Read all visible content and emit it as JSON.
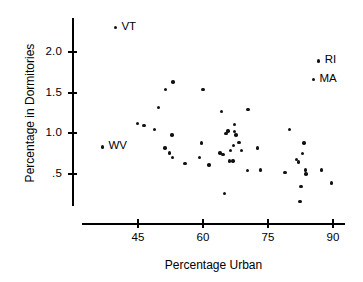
{
  "chart_data": {
    "type": "scatter",
    "title": "",
    "xlabel": "Percentage Urban",
    "ylabel": "Percentage in Dormitories",
    "xlim": [
      36,
      92
    ],
    "ylim": [
      0.1,
      2.45
    ],
    "xticks": [
      45,
      60,
      75,
      90
    ],
    "xtick_labels": [
      "45",
      "60",
      "75",
      "90"
    ],
    "yticks": [
      2.0,
      1.5,
      1.0,
      0.5
    ],
    "ytick_labels": [
      "2.0",
      "1.5",
      "1.0",
      ".5"
    ],
    "grid": false,
    "legend": "none",
    "marker": "dot",
    "marker_color": "#111111",
    "points": [
      {
        "x": 39.8,
        "y": 2.3,
        "label": "VT"
      },
      {
        "x": 36.8,
        "y": 0.83,
        "label": "WV"
      },
      {
        "x": 86.7,
        "y": 1.89,
        "label": "RI"
      },
      {
        "x": 85.5,
        "y": 1.66,
        "label": "MA"
      },
      {
        "x": 44.9,
        "y": 1.12,
        "label": ""
      },
      {
        "x": 46.4,
        "y": 1.1,
        "label": ""
      },
      {
        "x": 48.8,
        "y": 1.05,
        "label": ""
      },
      {
        "x": 49.7,
        "y": 1.32,
        "label": ""
      },
      {
        "x": 51.4,
        "y": 1.54,
        "label": ""
      },
      {
        "x": 53.1,
        "y": 1.63,
        "label": ""
      },
      {
        "x": 52.8,
        "y": 0.98,
        "label": ""
      },
      {
        "x": 51.2,
        "y": 0.82,
        "label": ""
      },
      {
        "x": 52.3,
        "y": 0.76,
        "label": ""
      },
      {
        "x": 53.0,
        "y": 0.7,
        "label": ""
      },
      {
        "x": 55.8,
        "y": 0.63,
        "label": ""
      },
      {
        "x": 59.2,
        "y": 0.7,
        "label": ""
      },
      {
        "x": 59.6,
        "y": 0.88,
        "label": ""
      },
      {
        "x": 60.0,
        "y": 1.54,
        "label": ""
      },
      {
        "x": 61.4,
        "y": 0.61,
        "label": ""
      },
      {
        "x": 64.3,
        "y": 1.27,
        "label": ""
      },
      {
        "x": 63.9,
        "y": 0.76,
        "label": ""
      },
      {
        "x": 64.6,
        "y": 0.74,
        "label": ""
      },
      {
        "x": 64.9,
        "y": 0.26,
        "label": ""
      },
      {
        "x": 65.3,
        "y": 1.0,
        "label": ""
      },
      {
        "x": 65.8,
        "y": 1.03,
        "label": ""
      },
      {
        "x": 66.1,
        "y": 0.66,
        "label": ""
      },
      {
        "x": 66.9,
        "y": 0.66,
        "label": ""
      },
      {
        "x": 66.3,
        "y": 0.79,
        "label": ""
      },
      {
        "x": 67.1,
        "y": 0.85,
        "label": ""
      },
      {
        "x": 67.3,
        "y": 1.11,
        "label": ""
      },
      {
        "x": 67.2,
        "y": 1.02,
        "label": ""
      },
      {
        "x": 67.6,
        "y": 0.98,
        "label": ""
      },
      {
        "x": 68.3,
        "y": 0.89,
        "label": ""
      },
      {
        "x": 68.9,
        "y": 0.79,
        "label": ""
      },
      {
        "x": 70.4,
        "y": 1.29,
        "label": ""
      },
      {
        "x": 70.2,
        "y": 0.54,
        "label": ""
      },
      {
        "x": 72.6,
        "y": 0.82,
        "label": ""
      },
      {
        "x": 73.3,
        "y": 0.55,
        "label": ""
      },
      {
        "x": 78.9,
        "y": 0.52,
        "label": ""
      },
      {
        "x": 79.9,
        "y": 1.05,
        "label": ""
      },
      {
        "x": 81.6,
        "y": 0.68,
        "label": ""
      },
      {
        "x": 82.0,
        "y": 0.65,
        "label": ""
      },
      {
        "x": 83.3,
        "y": 0.88,
        "label": ""
      },
      {
        "x": 82.9,
        "y": 0.75,
        "label": ""
      },
      {
        "x": 83.6,
        "y": 0.55,
        "label": ""
      },
      {
        "x": 83.8,
        "y": 0.5,
        "label": ""
      },
      {
        "x": 82.6,
        "y": 0.35,
        "label": ""
      },
      {
        "x": 82.4,
        "y": 0.16,
        "label": ""
      },
      {
        "x": 87.4,
        "y": 0.55,
        "label": ""
      },
      {
        "x": 89.6,
        "y": 0.39,
        "label": ""
      }
    ]
  }
}
